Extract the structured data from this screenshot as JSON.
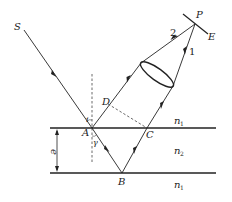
{
  "diagram": {
    "type": "thin-film-interference",
    "points": {
      "S": "S",
      "A": "A",
      "B": "B",
      "C": "C",
      "D": "D",
      "P": "P",
      "E": "E"
    },
    "angles": {
      "incidence": "i",
      "refraction": "γ"
    },
    "rays": {
      "ray1": "1",
      "ray2": "2"
    },
    "thickness": "e",
    "media": {
      "top": "n",
      "top_sub": "1",
      "middle": "n",
      "middle_sub": "2",
      "bottom": "n",
      "bottom_sub": "1"
    }
  }
}
